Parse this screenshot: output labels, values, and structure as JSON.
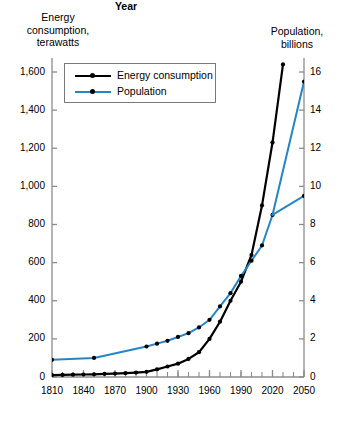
{
  "chart_data": {
    "type": "line",
    "title": "",
    "xlabel": "Year",
    "left_axis_title": "Energy\nconsumption,\nterawatts",
    "right_axis_title": "Population,\nbillions",
    "xlim": [
      1810,
      2050
    ],
    "xticks": [
      1810,
      1840,
      1870,
      1900,
      1930,
      1960,
      1990,
      2020,
      2050
    ],
    "xtick_labels": [
      "1810",
      "1840",
      "1870",
      "1900",
      "1930",
      "1960",
      "1990",
      "2020",
      "2050"
    ],
    "x_minor_tick_step": 10,
    "left_ylim": [
      0,
      1600
    ],
    "left_yticks": [
      0,
      200,
      400,
      600,
      800,
      1000,
      1200,
      1400,
      1600
    ],
    "left_ytick_labels": [
      "0",
      "200",
      "400",
      "600",
      "800",
      "1,000",
      "1,200",
      "1,400",
      "1,600"
    ],
    "right_ylim": [
      0,
      16
    ],
    "right_yticks": [
      0,
      2,
      4,
      6,
      8,
      10,
      12,
      14,
      16
    ],
    "right_ytick_labels": [
      "0",
      "2",
      "4",
      "6",
      "8",
      "10",
      "12",
      "14",
      "16"
    ],
    "grid": false,
    "legend_position": "upper-left-inside",
    "series": [
      {
        "name": "Energy consumption",
        "axis": "left",
        "color": "#000000",
        "unit": "terawatts",
        "points": [
          {
            "x": 1810,
            "y": 10
          },
          {
            "x": 1820,
            "y": 11
          },
          {
            "x": 1830,
            "y": 12
          },
          {
            "x": 1840,
            "y": 13
          },
          {
            "x": 1850,
            "y": 14
          },
          {
            "x": 1860,
            "y": 16
          },
          {
            "x": 1870,
            "y": 18
          },
          {
            "x": 1880,
            "y": 20
          },
          {
            "x": 1890,
            "y": 23
          },
          {
            "x": 1900,
            "y": 27
          },
          {
            "x": 1910,
            "y": 40
          },
          {
            "x": 1920,
            "y": 55
          },
          {
            "x": 1930,
            "y": 70
          },
          {
            "x": 1940,
            "y": 95
          },
          {
            "x": 1950,
            "y": 130
          },
          {
            "x": 1960,
            "y": 200
          },
          {
            "x": 1970,
            "y": 290
          },
          {
            "x": 1980,
            "y": 400
          },
          {
            "x": 1990,
            "y": 500
          },
          {
            "x": 2000,
            "y": 640
          },
          {
            "x": 2010,
            "y": 900
          },
          {
            "x": 2020,
            "y": 1230
          },
          {
            "x": 2030,
            "y": 1640
          }
        ]
      },
      {
        "name": "Population",
        "axis": "right",
        "color": "#2585c5",
        "unit": "billions",
        "points": [
          {
            "x": 1810,
            "y": 0.9
          },
          {
            "x": 1850,
            "y": 1.0
          },
          {
            "x": 1900,
            "y": 1.6
          },
          {
            "x": 1910,
            "y": 1.75
          },
          {
            "x": 1920,
            "y": 1.9
          },
          {
            "x": 1930,
            "y": 2.1
          },
          {
            "x": 1940,
            "y": 2.3
          },
          {
            "x": 1950,
            "y": 2.6
          },
          {
            "x": 1960,
            "y": 3.0
          },
          {
            "x": 1970,
            "y": 3.7
          },
          {
            "x": 1980,
            "y": 4.4
          },
          {
            "x": 1990,
            "y": 5.3
          },
          {
            "x": 2000,
            "y": 6.1
          },
          {
            "x": 2010,
            "y": 6.9
          },
          {
            "x": 2020,
            "y": 8.5
          }
        ]
      },
      {
        "name": "Population high projection",
        "axis": "right",
        "color": "#2585c5",
        "unit": "billions",
        "points": [
          {
            "x": 2020,
            "y": 8.5
          },
          {
            "x": 2050,
            "y": 15.5
          }
        ]
      },
      {
        "name": "Population low projection",
        "axis": "right",
        "color": "#2585c5",
        "unit": "billions",
        "points": [
          {
            "x": 2020,
            "y": 8.5
          },
          {
            "x": 2050,
            "y": 9.5
          }
        ]
      }
    ]
  },
  "legend": {
    "entries": [
      {
        "label": "Energy consumption",
        "color": "#000000"
      },
      {
        "label": "Population",
        "color": "#2585c5"
      }
    ]
  }
}
